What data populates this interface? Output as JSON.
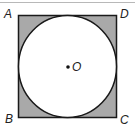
{
  "figure": {
    "square": {
      "vertices": [
        "A",
        "D",
        "C",
        "B"
      ],
      "fill": "#a9a9a9",
      "stroke": "#1a1a1a"
    },
    "circle": {
      "center_label": "O",
      "fill": "#ffffff",
      "stroke": "#1a1a1a",
      "inscribed": true
    },
    "labels": {
      "A": "A",
      "B": "B",
      "C": "C",
      "D": "D",
      "O": "O"
    }
  }
}
